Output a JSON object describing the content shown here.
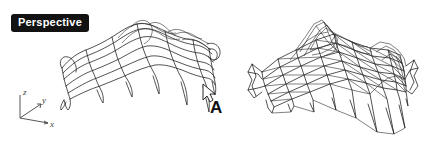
{
  "viewport": {
    "label": "Perspective",
    "background_color": "#ffffff",
    "line_color": "#1a1a1a",
    "label_bg_color": "#121212",
    "label_text_color": "#ffffff"
  },
  "axis_gizmo": {
    "name": "xyz-axis-indicator",
    "axes": [
      {
        "id": "z",
        "label": "z",
        "direction": "up"
      },
      {
        "id": "y",
        "label": "y",
        "direction": "up-right"
      },
      {
        "id": "x",
        "label": "x",
        "direction": "right-down"
      }
    ]
  },
  "annotations": [
    {
      "id": "A",
      "label": "A",
      "x": 210,
      "y": 99
    }
  ],
  "cursor": {
    "name": "mouse-arrow-cursor",
    "x": 203,
    "y": 84
  },
  "objects": [
    {
      "id": "left-surface",
      "name": "smooth-quad-wireframe-surface",
      "type": "nurbs-surface-wireframe",
      "description": "Smooth quad grid wireframe of an undulating surface",
      "bounds": {
        "x": 60,
        "y": 22,
        "width": 155,
        "height": 110
      }
    },
    {
      "id": "right-mesh",
      "name": "triangulated-polygon-mesh",
      "type": "polygon-mesh-wireframe",
      "description": "Faceted triangulated polygon mesh of the same undulating surface",
      "bounds": {
        "x": 240,
        "y": 20,
        "width": 180,
        "height": 120
      }
    }
  ]
}
